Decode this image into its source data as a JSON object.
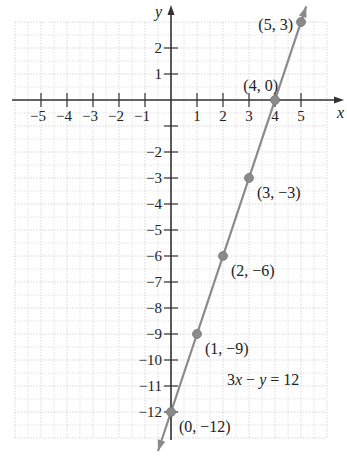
{
  "chart_data": {
    "type": "line",
    "title": "",
    "xlabel": "x",
    "ylabel": "y",
    "equation": "3x − y = 12",
    "xlim": [
      -6,
      6
    ],
    "ylim": [
      -13,
      3
    ],
    "grid": true,
    "x_ticks": [
      -5,
      -4,
      -3,
      -2,
      -1,
      1,
      2,
      3,
      4,
      5
    ],
    "x_tick_labels": [
      "−5",
      "−4",
      "−3",
      "−2",
      "−1",
      "1",
      "2",
      "3",
      "4",
      "5"
    ],
    "y_ticks": [
      2,
      1,
      -1,
      -2,
      -3,
      -4,
      -5,
      -6,
      -7,
      -8,
      -9,
      -10,
      -11,
      -12
    ],
    "y_tick_labels": [
      "2",
      "1",
      "",
      "−2",
      "−3",
      "−4",
      "−5",
      "−6",
      "−7",
      "−8",
      "−9",
      "−10",
      "−11",
      "−12"
    ],
    "series": [
      {
        "name": "3x − y = 12",
        "x": [
          0,
          1,
          2,
          3,
          4,
          5
        ],
        "y": [
          -12,
          -9,
          -6,
          -3,
          0,
          3
        ],
        "point_labels": [
          "(0, −12)",
          "(1, −9)",
          "(2, −6)",
          "(3, −3)",
          "(4, 0)",
          "(5, 3)"
        ]
      }
    ],
    "colors": {
      "line": "#8a8a8a",
      "point": "#8a8a8a",
      "axis": "#333333",
      "grid": "#d6d6d6"
    }
  }
}
